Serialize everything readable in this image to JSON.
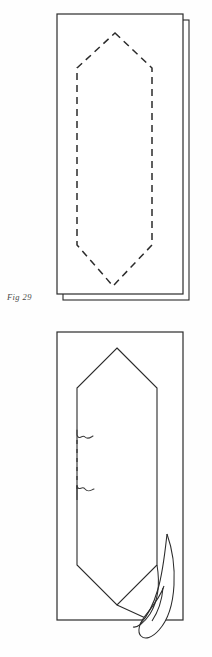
{
  "plate": {
    "name": "pattern-plate",
    "background_color": "#fefefe",
    "width": 212,
    "height": 657
  },
  "figures": [
    {
      "id": "fig-29",
      "caption": "Fig 29",
      "description": "Rectangular panel with a second offset panel behind it and a dashed hexagonal outline stitched inside",
      "line_color": "#2b2b2b",
      "fill_color": "#ffffff",
      "sheet": {
        "front_rect": {
          "x": 57,
          "y": 14,
          "width": 126,
          "height": 280
        },
        "back_rect": {
          "x": 63,
          "y": 20,
          "width": 126,
          "height": 280
        }
      },
      "hexagon": {
        "style": "dashed",
        "dash_pattern": "7 5",
        "points": "115,33 152,68 152,245 113,286 77,245 77,68"
      }
    },
    {
      "id": "fig-30",
      "caption": "Fig 30",
      "description": "Rectangular panel with a solid hexagonal outline, a central dashed seam between two break marks, and a curled flap at the lower right",
      "line_color": "#2b2b2b",
      "fill_color": "#ffffff",
      "sheet": {
        "front_rect": {
          "x": 57,
          "y": 332,
          "width": 126,
          "height": 288
        }
      },
      "hexagon": {
        "style": "solid",
        "points": "117,348 157,388 157,565 117,605 77,565 77,388"
      },
      "seam": {
        "style": "dashed",
        "dash_pattern": "4 5",
        "x": 77,
        "y_top": 440,
        "y_bottom": 490
      },
      "break_marks": [
        {
          "name": "upper-break-mark",
          "x": 77,
          "y": 437
        },
        {
          "name": "lower-break-mark",
          "x": 77,
          "y": 492
        }
      ],
      "flap": {
        "name": "curled-flap",
        "description": "double-curved peeled corner flap overlapping the right edge"
      },
      "fold_line": {
        "name": "fold-line",
        "from": [
          117,
          605
        ],
        "to": [
          150,
          620
        ]
      }
    }
  ],
  "colors": {
    "ink": "#2b2b2b",
    "ink_soft": "#555555",
    "caption": "#4a4a4a",
    "paper": "#fefefe",
    "panel": "#ffffff"
  }
}
